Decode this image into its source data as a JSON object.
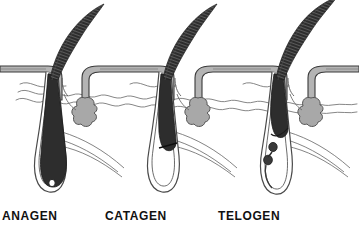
{
  "figure": {
    "background_color": "#ffffff",
    "width": 359,
    "height": 228
  },
  "labels": {
    "anagen": "ANAGEN",
    "catagen": "CATAGEN",
    "telogen": "TELOGEN"
  },
  "colors": {
    "hair_shaft": "#2b2b2b",
    "hair_shaft_dark": "#1a1a1a",
    "epidermis_fill": "#b4b4b4",
    "epidermis_outline": "#3a3a3a",
    "sebaceous_gland": "#a8a8a8",
    "sebaceous_outline": "#555555",
    "dermis_line": "#6b6b6b",
    "follicle_outline": "#4a4a4a",
    "papilla_fill": "#ffffff",
    "label_text": "#111111"
  },
  "stages": [
    {
      "id": "anagen",
      "label": "ANAGEN",
      "order": 1,
      "description": "Growth phase: deep follicle, hair matrix surrounds dermal papilla at bulb",
      "follicle_depth": "deep",
      "has_dermal_papilla": true,
      "has_club_hair": false,
      "has_epithelial_strand": false
    },
    {
      "id": "catagen",
      "label": "CATAGEN",
      "order": 2,
      "description": "Regression phase: hair bulb retracts upward, lower follicle collapses into empty sac",
      "follicle_depth": "retracting",
      "has_dermal_papilla": false,
      "has_club_hair": true,
      "has_epithelial_strand": false
    },
    {
      "id": "telogen",
      "label": "TELOGEN",
      "order": 3,
      "description": "Resting phase: club hair held high with beaded epithelial strand below",
      "follicle_depth": "shallow",
      "has_dermal_papilla": false,
      "has_club_hair": true,
      "has_epithelial_strand": true
    }
  ],
  "anatomy": {
    "epidermis": "epidermis-band",
    "dermis": "dermis-wavy-lines",
    "sebaceous_gland": "sebaceous-gland",
    "hair_shaft": "hair-shaft",
    "hair_follicle": "hair-follicle",
    "dermal_papilla": "dermal-papilla",
    "arrector_pili": "arrector-pili-muscle"
  }
}
